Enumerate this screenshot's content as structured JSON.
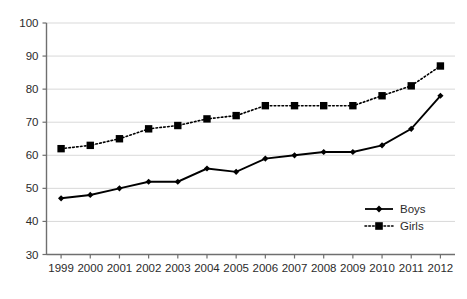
{
  "chart_data": {
    "type": "line",
    "title": "",
    "subtitle": "",
    "xlabel": "",
    "ylabel": "",
    "categories": [
      "1999",
      "2000",
      "2001",
      "2002",
      "2003",
      "2004",
      "2005",
      "2006",
      "2007",
      "2008",
      "2009",
      "2010",
      "2011",
      "2012"
    ],
    "series": [
      {
        "name": "Boys",
        "values": [
          47,
          48,
          50,
          52,
          52,
          56,
          55,
          59,
          60,
          61,
          61,
          63,
          68,
          78
        ],
        "line_style": "solid",
        "marker": "diamond",
        "color": "#000000"
      },
      {
        "name": "Girls",
        "values": [
          62,
          63,
          65,
          68,
          69,
          71,
          72,
          75,
          75,
          75,
          75,
          78,
          81,
          87
        ],
        "line_style": "dotted",
        "marker": "square",
        "color": "#000000"
      }
    ],
    "ylim": [
      30,
      100
    ],
    "yticks": [
      30,
      40,
      50,
      60,
      70,
      80,
      90,
      100
    ],
    "ytick_labels": [
      "30",
      "40",
      "50",
      "60",
      "70",
      "80",
      "90",
      "100"
    ],
    "xtick_labels": [
      "1999",
      "2000",
      "2001",
      "2002",
      "2003",
      "2004",
      "2005",
      "2006",
      "2007",
      "2008",
      "2009",
      "2010",
      "2011",
      "2012"
    ],
    "grid": {
      "horizontal": true,
      "vertical": false,
      "color": "#d9d9d9"
    },
    "legend": {
      "position": "inside-bottom-right",
      "entries": [
        "Boys",
        "Girls"
      ]
    },
    "axis_color": "#808080",
    "plot_background": "#ffffff"
  },
  "legend": {
    "boys_label": "Boys",
    "girls_label": "Girls"
  },
  "axes": {
    "y_labels": [
      "100",
      "90",
      "80",
      "70",
      "60",
      "50",
      "40",
      "30"
    ],
    "x_labels": [
      "1999",
      "2000",
      "2001",
      "2002",
      "2003",
      "2004",
      "2005",
      "2006",
      "2007",
      "2008",
      "2009",
      "2010",
      "2011",
      "2012"
    ]
  }
}
